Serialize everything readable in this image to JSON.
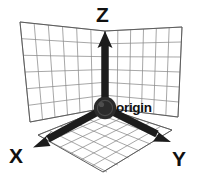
{
  "diagram": {
    "background_color": "#ffffff",
    "axis_color": "#1c1c1c",
    "grid_color": "#8a8a8a",
    "label_color": "#111111",
    "origin_marker_color": "#2b2b2b",
    "labels": {
      "x": "X",
      "y": "Y",
      "z": "Z",
      "origin": "origin"
    },
    "axes": [
      {
        "name": "z-axis",
        "label": "Z",
        "direction": "up",
        "start": [
          105,
          108
        ],
        "end": [
          105,
          33
        ],
        "has_arrowhead": true
      },
      {
        "name": "x-axis",
        "label": "X",
        "direction": "down-left",
        "start": [
          105,
          108
        ],
        "end": [
          41,
          143
        ],
        "has_arrowhead": true
      },
      {
        "name": "y-axis",
        "label": "Y",
        "direction": "down-right",
        "start": [
          105,
          108
        ],
        "end": [
          164,
          138
        ],
        "has_arrowhead": true
      }
    ],
    "origin": {
      "name": "origin",
      "center": [
        105,
        108
      ],
      "radius": 11
    },
    "planes": [
      {
        "name": "xz-plane-wall-left",
        "corners": [
          [
            20,
            22
          ],
          [
            105,
            31
          ],
          [
            105,
            108
          ],
          [
            30,
            122
          ]
        ],
        "grid_rows": 6,
        "grid_cols": 6
      },
      {
        "name": "yz-plane-wall-right",
        "corners": [
          [
            105,
            31
          ],
          [
            182,
            27
          ],
          [
            178,
            117
          ],
          [
            105,
            108
          ]
        ],
        "grid_rows": 6,
        "grid_cols": 6
      },
      {
        "name": "xy-plane-floor",
        "corners": [
          [
            105,
            108
          ],
          [
            38,
            135
          ],
          [
            103,
            172
          ],
          [
            172,
            130
          ]
        ],
        "grid_rows": 6,
        "grid_cols": 6
      }
    ],
    "label_positions": {
      "z": [
        96,
        22
      ],
      "x": [
        10,
        162
      ],
      "y": [
        174,
        165
      ],
      "origin": [
        117,
        112
      ]
    }
  }
}
